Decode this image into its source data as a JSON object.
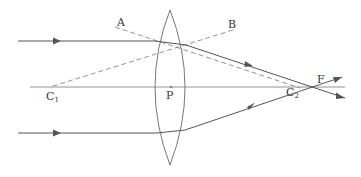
{
  "diagram": {
    "type": "ray-optics",
    "colors": {
      "line": "#555555",
      "dashed": "#777777",
      "text": "#333333",
      "background": "#ffffff"
    },
    "labels": {
      "A": "A",
      "B": "B",
      "C1": "C",
      "C1_sub": "1",
      "P": "P",
      "C2": "C",
      "C2_sub": "2",
      "F": "F"
    },
    "elements": {
      "principal_axis": "horizontal line through C1, P, C2, F",
      "lens": "biconvex lens centered at P",
      "incident_ray_top": "parallel ray above axis, refracts toward F",
      "incident_ray_bottom": "parallel ray below axis, refracts toward F",
      "normal_A": "dashed normal line through A toward C2",
      "normal_B": "dashed normal line through B toward C1"
    }
  }
}
